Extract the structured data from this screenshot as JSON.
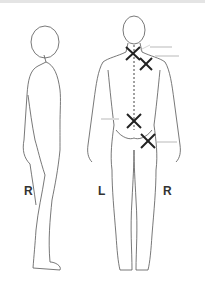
{
  "diagram": {
    "title": "",
    "views": [
      {
        "name": "side-view",
        "orientation_label": "R"
      },
      {
        "name": "back-view",
        "left_label": "L",
        "right_label": "R"
      }
    ],
    "markers": [
      {
        "id": "upper-neck",
        "symbol": "X",
        "x": 133,
        "y": 53
      },
      {
        "id": "right-shoulder",
        "symbol": "X",
        "x": 146,
        "y": 64
      },
      {
        "id": "lower-back",
        "symbol": "X",
        "x": 134,
        "y": 121
      },
      {
        "id": "right-buttock",
        "symbol": "X",
        "x": 148,
        "y": 141
      }
    ],
    "spine_line": {
      "style": "dashed",
      "x": 134,
      "y_start": 45,
      "y_end": 130
    },
    "colors": {
      "line": "#555555",
      "marker": "#222222",
      "label_text": "#cccccc"
    }
  }
}
